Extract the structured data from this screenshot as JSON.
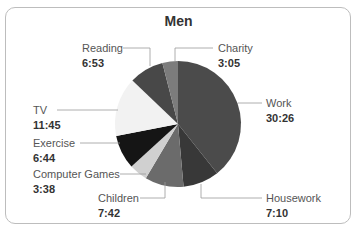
{
  "chart_data": {
    "type": "pie",
    "title": "Men",
    "categories": [
      "Work",
      "Housework",
      "Children",
      "Computer Games",
      "Exercise",
      "TV",
      "Reading",
      "Charity"
    ],
    "values": [
      "30:26",
      "7:10",
      "7:42",
      "3:38",
      "6:44",
      "11:45",
      "6:53",
      "3:05"
    ],
    "values_minutes": [
      1826,
      430,
      462,
      218,
      404,
      705,
      413,
      185
    ],
    "colors": [
      "#4b4b4b",
      "#383838",
      "#6b6b6b",
      "#d0d0d0",
      "#151515",
      "#f2f2f2",
      "#484848",
      "#7c7c7c"
    ],
    "start_angle_deg": 0,
    "direction": "clockwise",
    "legend": "leader-line labels"
  },
  "labels": [
    {
      "name": "Work",
      "value": "30:26"
    },
    {
      "name": "Housework",
      "value": "7:10"
    },
    {
      "name": "Children",
      "value": "7:42"
    },
    {
      "name": "Computer Games",
      "value": "3:38"
    },
    {
      "name": "Exercise",
      "value": "6:44"
    },
    {
      "name": "TV",
      "value": "11:45"
    },
    {
      "name": "Reading",
      "value": "6:53"
    },
    {
      "name": "Charity",
      "value": "3:05"
    }
  ]
}
